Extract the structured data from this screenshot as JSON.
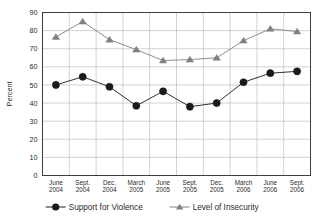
{
  "chart_data": {
    "type": "line",
    "title": "",
    "xlabel": "",
    "ylabel": "Percent",
    "ylim": [
      0,
      90
    ],
    "ytick_step": 10,
    "yticks": [
      0,
      10,
      20,
      30,
      40,
      50,
      60,
      70,
      80,
      90
    ],
    "grid": {
      "horizontal": true,
      "vertical": true
    },
    "legend_position": "bottom",
    "categories": [
      "June\n2004",
      "Sept.\n2004",
      "Dec.\n2004",
      "March\n2005",
      "June\n2005",
      "Sept.\n2005",
      "Dec.\n2005",
      "March\n2006",
      "June\n2006",
      "Sept.\n2006"
    ],
    "category_lines": [
      [
        "June",
        "2004"
      ],
      [
        "Sept.",
        "2004"
      ],
      [
        "Dec.",
        "2004"
      ],
      [
        "March",
        "2005"
      ],
      [
        "June",
        "2005"
      ],
      [
        "Sept.",
        "2005"
      ],
      [
        "Dec.",
        "2005"
      ],
      [
        "March",
        "2006"
      ],
      [
        "June",
        "2006"
      ],
      [
        "Sept.",
        "2006"
      ]
    ],
    "series": [
      {
        "name": "Support for Violence",
        "marker": "circle",
        "color": "#1a1a1a",
        "values": [
          50,
          54.5,
          49,
          38.5,
          46.5,
          38,
          40,
          51.5,
          56.5,
          57.5
        ]
      },
      {
        "name": "Level of Insecurity",
        "marker": "triangle",
        "color": "#808080",
        "values": [
          76.5,
          85,
          75,
          69.5,
          63.5,
          64,
          65,
          74.5,
          81,
          79.5
        ]
      }
    ]
  },
  "legend": {
    "items": [
      {
        "label": "Support for Violence",
        "marker": "circle",
        "color": "#1a1a1a"
      },
      {
        "label": "Level of Insecurity",
        "marker": "triangle",
        "color": "#808080"
      }
    ]
  },
  "colors": {
    "plot_border": "#3d3d3d",
    "grid": "#bfbfbf",
    "background": "#ffffff",
    "series_dark": "#1a1a1a",
    "series_gray": "#808080"
  }
}
